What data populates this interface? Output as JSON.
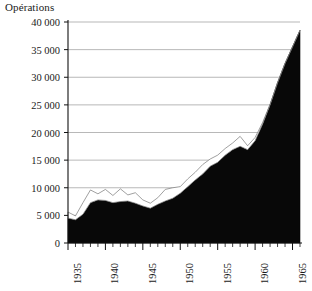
{
  "chart_data": {
    "type": "area",
    "title": "Opérations",
    "xlabel": "",
    "ylabel": "Opérations",
    "xlim": [
      1935,
      1966
    ],
    "ylim": [
      0,
      40000
    ],
    "grid": true,
    "legend": "none",
    "y_ticks": [
      0,
      5000,
      10000,
      15000,
      20000,
      25000,
      30000,
      35000,
      40000
    ],
    "y_tick_labels": [
      "0",
      "5 000",
      "10 000",
      "15 000",
      "20 000",
      "25 000",
      "30 000",
      "35 000",
      "40 000"
    ],
    "x_ticks": [
      1935,
      1940,
      1945,
      1950,
      1955,
      1960,
      1965
    ],
    "x_tick_labels": [
      "1935",
      "1940",
      "1945",
      "1950",
      "1955",
      "1960",
      "1965"
    ],
    "x_minor_step": 1,
    "x": [
      1935,
      1936,
      1937,
      1938,
      1939,
      1940,
      1941,
      1942,
      1943,
      1944,
      1945,
      1946,
      1947,
      1948,
      1949,
      1950,
      1951,
      1952,
      1953,
      1954,
      1955,
      1956,
      1957,
      1958,
      1959,
      1960,
      1961,
      1962,
      1963,
      1964,
      1965,
      1966
    ],
    "series": [
      {
        "name": "black-area",
        "style": "filled-black",
        "values": [
          4500,
          4200,
          5200,
          7300,
          7800,
          7700,
          7300,
          7500,
          7600,
          7200,
          6700,
          6300,
          7000,
          7600,
          8100,
          9000,
          10200,
          11400,
          12500,
          13900,
          14600,
          15900,
          16900,
          17500,
          16900,
          18500,
          21500,
          25000,
          29000,
          32500,
          35500,
          38500
        ]
      },
      {
        "name": "white-band-line",
        "style": "white-filled-outline",
        "values": [
          5600,
          4900,
          7300,
          9600,
          8900,
          9700,
          8600,
          9800,
          8700,
          9100,
          7800,
          7200,
          8200,
          9700,
          10000,
          10200,
          11600,
          12800,
          14200,
          15200,
          15900,
          17100,
          18100,
          19300,
          17600,
          19100,
          21800,
          25100,
          29000,
          32500,
          35500,
          38500
        ]
      }
    ]
  }
}
